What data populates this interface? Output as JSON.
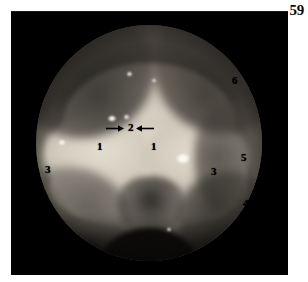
{
  "page": {
    "number": "59",
    "background_color": "#ffffff"
  },
  "plate": {
    "background_color": "#000000",
    "caption": ""
  },
  "figure": {
    "type": "endoscopic-photograph",
    "field_shape": "circle",
    "modality": "laryngoscopy",
    "tissue_color": "#d8d2c6",
    "shadow_color": "#2a2823"
  },
  "annotations": {
    "label_color": "#000000",
    "items": [
      {
        "id": "label-1-left",
        "text": "1",
        "x": 97,
        "y": 141
      },
      {
        "id": "label-1-right",
        "text": "1",
        "x": 151,
        "y": 141
      },
      {
        "id": "label-2",
        "text": "2",
        "x": 128,
        "y": 122
      },
      {
        "id": "label-3-left",
        "text": "3",
        "x": 45,
        "y": 164
      },
      {
        "id": "label-3-right",
        "text": "3",
        "x": 211,
        "y": 166
      },
      {
        "id": "label-4",
        "text": "4",
        "x": 243,
        "y": 198
      },
      {
        "id": "label-5",
        "text": "5",
        "x": 241,
        "y": 152
      },
      {
        "id": "label-6",
        "text": "6",
        "x": 232,
        "y": 75
      }
    ],
    "arrows": [
      {
        "id": "arrow-left",
        "direction": "right",
        "x": 106,
        "y": 124,
        "length": 18
      },
      {
        "id": "arrow-right",
        "direction": "left",
        "x": 136,
        "y": 124,
        "length": 18
      }
    ]
  },
  "highlights": [
    {
      "id": "spec-top-center",
      "x": 127,
      "y": 72,
      "w": 5,
      "h": 4
    },
    {
      "id": "spec-top-right",
      "x": 152,
      "y": 79,
      "w": 4,
      "h": 3
    },
    {
      "id": "spec-mid-left",
      "x": 108,
      "y": 116,
      "w": 8,
      "h": 5
    },
    {
      "id": "spec-mid-center",
      "x": 124,
      "y": 115,
      "w": 5,
      "h": 4
    },
    {
      "id": "spec-left-fold",
      "x": 59,
      "y": 140,
      "w": 6,
      "h": 5
    },
    {
      "id": "spec-right-fold",
      "x": 176,
      "y": 154,
      "w": 14,
      "h": 9
    },
    {
      "id": "spec-lower",
      "x": 167,
      "y": 228,
      "w": 4,
      "h": 3
    }
  ]
}
